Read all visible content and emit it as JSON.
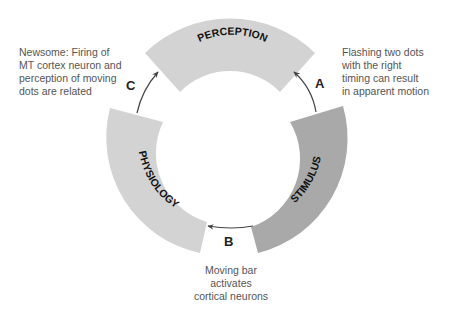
{
  "diagram": {
    "segments": [
      {
        "id": "perception",
        "label": "PERCEPTION",
        "color": "#d3d3d3"
      },
      {
        "id": "stimulus",
        "label": "STIMULUS",
        "color": "#a9a9a9"
      },
      {
        "id": "physiology",
        "label": "PHYSIOLOGY",
        "color": "#d3d3d3"
      }
    ],
    "arrows": [
      {
        "label": "A",
        "from": "stimulus",
        "to": "perception"
      },
      {
        "label": "B",
        "from": "stimulus",
        "to": "physiology"
      },
      {
        "label": "C",
        "from": "physiology",
        "to": "perception"
      }
    ],
    "notes": {
      "c": [
        "Newsome: Firing of",
        "MT cortex neuron and",
        "perception of moving",
        "dots are related"
      ],
      "a": [
        "Flashing two dots",
        "with the right",
        "timing can result",
        "in apparent motion"
      ],
      "b": [
        "Moving bar",
        "activates",
        "cortical neurons"
      ]
    },
    "text_color": "#555555",
    "arrow_color": "#444444"
  }
}
